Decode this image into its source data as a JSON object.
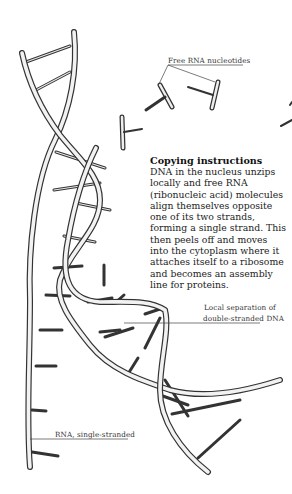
{
  "diagram": {
    "labels": {
      "free_nucleotides": "Free RNA nucleotides",
      "local_separation_line1": "Local separation of",
      "local_separation_line2": "double-stranded DNA",
      "rna_single": "RNA, single-stranded"
    },
    "caption": {
      "title": "Copying instructions",
      "lines": [
        "DNA in the nucleus unzips",
        "locally and free RNA",
        "(ribonucleic acid) molecules",
        "align themselves opposite",
        "one of its two strands,",
        "forming a single strand. This",
        "then peels off and moves",
        "into the cytoplasm where it",
        "attaches itself to a ribosome",
        "and becomes an assembly",
        "line for proteins."
      ]
    },
    "colors": {
      "ink": "#333333",
      "strand_fill": "#f4f4f4",
      "background": "#ffffff"
    }
  }
}
